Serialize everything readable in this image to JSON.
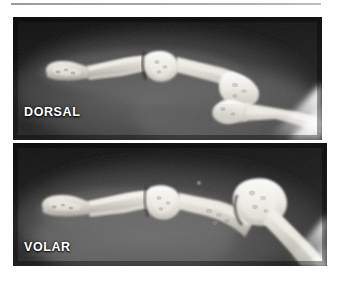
{
  "figure": {
    "kind": "radiograph-figure",
    "divider_rule": "horizontal-rule",
    "background_color": "#ffffff",
    "rule_color": "#a8a8a8"
  },
  "panels": [
    {
      "id": "dorsal",
      "label": "DORSAL",
      "modality": "x-ray",
      "projection": "lateral",
      "anatomy": "finger phalanges and metacarpal head",
      "background_color": "#141414",
      "bone_color": "#e8e6e0",
      "soft_tissue_color": "#6f6f6f",
      "label_color": "#ffffff"
    },
    {
      "id": "volar",
      "label": "VOLAR",
      "modality": "x-ray",
      "projection": "lateral",
      "anatomy": "finger phalanges and metacarpal head",
      "background_color": "#161616",
      "bone_color": "#eceae4",
      "soft_tissue_color": "#757575",
      "label_color": "#ffffff"
    }
  ]
}
